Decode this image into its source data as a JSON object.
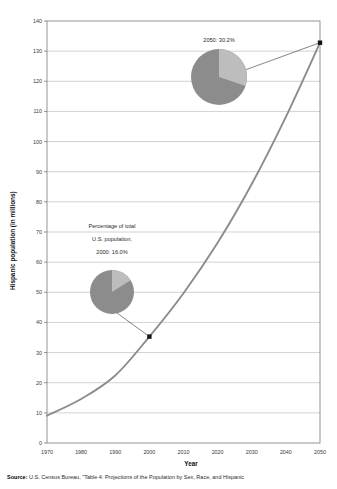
{
  "chart_data": {
    "type": "line",
    "title": "",
    "xlabel": "Year",
    "ylabel": "Hispanic population (in millions)",
    "xlim": [
      1970,
      2050
    ],
    "ylim": [
      0,
      140
    ],
    "ytick_step": 10,
    "xtick_step": 10,
    "grid": true,
    "grid_axis": "y",
    "legend": null,
    "xticks": [
      "1970",
      "1980",
      "1990",
      "2000",
      "2010",
      "2020",
      "2030",
      "2040",
      "2050"
    ],
    "yticks": [
      "0",
      "10",
      "20",
      "30",
      "40",
      "50",
      "60",
      "70",
      "80",
      "90",
      "100",
      "110",
      "120",
      "130",
      "140"
    ],
    "series": [
      {
        "name": "Hispanic population",
        "color": "#8c8c8c",
        "x": [
          1970,
          1980,
          1990,
          2000,
          2010,
          2020,
          2030,
          2040,
          2050
        ],
        "values": [
          9.1,
          14.6,
          22.4,
          35.3,
          49.7,
          66.4,
          85.9,
          108.2,
          132.8
        ]
      }
    ],
    "markers": [
      {
        "x": 2000,
        "y": 35.3,
        "label": "2000"
      },
      {
        "x": 2050,
        "y": 132.8,
        "label": "2050"
      }
    ],
    "annotations": [
      {
        "name": "percentage-2000",
        "lines": [
          "Percentage of total",
          "U.S. population,",
          "2000: 16.0%"
        ],
        "pie": {
          "share": 16.0,
          "color_fill": "#8c8c8c",
          "color_slice": "#bdbdbd"
        }
      },
      {
        "name": "percentage-2050",
        "lines": [
          "2050: 30.2%"
        ],
        "pie": {
          "share": 30.2,
          "color_fill": "#8c8c8c",
          "color_slice": "#bdbdbd"
        }
      }
    ]
  },
  "axes": {
    "x_title": "Year",
    "y_title": "Hispanic population (in millions)",
    "y_labels": [
      "140",
      "130",
      "120",
      "110",
      "100",
      "90",
      "80",
      "70",
      "60",
      "50",
      "40",
      "30",
      "20",
      "10",
      "0"
    ],
    "x_labels": [
      "1970",
      "1980",
      "1990",
      "2000",
      "2010",
      "2020",
      "2030",
      "2040",
      "2050"
    ]
  },
  "annotations": {
    "callout_2000": {
      "line1": "Percentage of total",
      "line2": "U.S. population,",
      "line3": "2000: 16.0%"
    },
    "callout_2050": {
      "line1": "2050: 30.2%"
    }
  },
  "source": {
    "prefix": "Source:",
    "text": " U.S. Census Bureau, \"Table 4: Projections of the Population by Sex, Race, and Hispanic"
  },
  "colors": {
    "line": "#8c8c8c",
    "marker": "#111111",
    "grid": "#b4b4b4",
    "frame": "#7a7a7a",
    "pie_main": "#8c8c8c",
    "pie_slice": "#bdbdbd",
    "text": "#2a2a2a"
  }
}
